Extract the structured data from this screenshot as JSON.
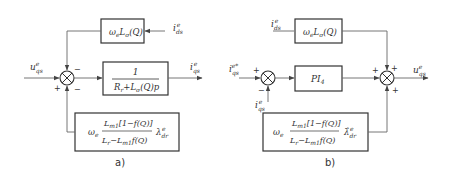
{
  "panel_a": {
    "caption": "a)",
    "input_label": "u",
    "input_sub": "qs",
    "input_sup": "e",
    "top_block": {
      "text": "ω",
      "sub1": "e",
      "rest": "L",
      "sub2": "σ",
      "arg": "(Q)"
    },
    "top_input": {
      "text": "i",
      "sub": "ds",
      "sup": "e"
    },
    "main_block": {
      "numerator": "1",
      "denominator": "R",
      "den_sub": "r",
      "den_rest": "+L",
      "den_sub2": "σ",
      "den_tail": "(Q)p"
    },
    "output_label": {
      "text": "i",
      "sub": "qs",
      "sup": "e"
    },
    "bottom_block": {
      "prefix": "ω",
      "prefix_sub": "e",
      "numerator": "L",
      "num_sub": "m1",
      "num_rest": "[1−f(Q)]",
      "denominator": "L",
      "den_sub": "r",
      "den_rest": "−L",
      "den_sub2": "m1",
      "den_tail": "f(Q)",
      "flux": "λ",
      "flux_sub": "dr",
      "flux_sup": "e"
    },
    "summer_signs": {
      "left": "+",
      "top": "−",
      "bottom": "−"
    }
  },
  "panel_b": {
    "caption": "b)",
    "ref_input": {
      "text": "i",
      "sub": "qs",
      "sup": "e*"
    },
    "feedback_input": {
      "text": "i",
      "sub": "qs",
      "sup": "e"
    },
    "top_input": {
      "text": "i",
      "sub": "ds",
      "sup": "e"
    },
    "top_block": {
      "text": "ω",
      "sub1": "e",
      "rest": "L",
      "sub2": "σ",
      "arg": "(Q)"
    },
    "pi_block": {
      "text": "PI",
      "sub": "4"
    },
    "output_label": {
      "text": "u",
      "sub": "qs",
      "sup": "e"
    },
    "bottom_block": {
      "prefix": "ω",
      "prefix_sub": "e",
      "numerator": "L",
      "num_sub": "m1",
      "num_rest": "[1−f(Q)]",
      "denominator": "L",
      "den_sub": "r",
      "den_rest": "−L",
      "den_sub2": "m1",
      "den_tail": "f(Q)",
      "flux": "λ̂",
      "flux_sub": "dr",
      "flux_sup": "e"
    },
    "summer1_signs": {
      "left": "+",
      "bottom": "−"
    },
    "summer2_signs": {
      "left": "+",
      "top": "+",
      "bottom": "+"
    }
  }
}
